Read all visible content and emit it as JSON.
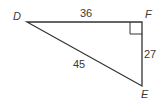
{
  "diagram": {
    "type": "right-triangle",
    "vertices": {
      "D": {
        "label": "D"
      },
      "E": {
        "label": "E"
      },
      "F": {
        "label": "F"
      }
    },
    "sides": {
      "DF": {
        "label": "36"
      },
      "FE": {
        "label": "27"
      },
      "DE": {
        "label": "45"
      }
    },
    "right_angle_at": "F",
    "line_color": "#333333"
  }
}
